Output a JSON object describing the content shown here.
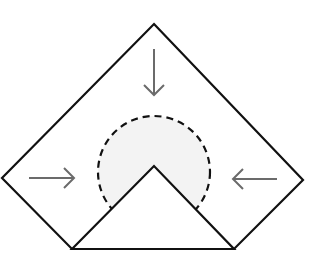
{
  "diagram": {
    "colors": {
      "outline": "#111111",
      "arrow": "#6b6b6b",
      "dashed_circle": "#111111",
      "circle_fill": "#f3f3f3",
      "background": "#ffffff"
    },
    "outer_shape": {
      "points": [
        [
          154,
          24
        ],
        [
          303,
          180
        ],
        [
          234,
          249
        ],
        [
          72,
          249
        ],
        [
          2,
          178
        ]
      ]
    },
    "inner_triangle": {
      "points": [
        [
          72,
          249
        ],
        [
          154,
          166
        ],
        [
          234,
          249
        ]
      ]
    },
    "dashed_circle": {
      "cx": 154,
      "cy": 172,
      "r": 56
    },
    "arrows": [
      {
        "name": "arrow-down",
        "direction": "down",
        "x1": 154,
        "y1": 49,
        "x2": 154,
        "y2": 95
      },
      {
        "name": "arrow-right",
        "direction": "right",
        "x1": 29,
        "y1": 178,
        "x2": 74,
        "y2": 178
      },
      {
        "name": "arrow-left",
        "direction": "left",
        "x1": 277,
        "y1": 179,
        "x2": 233,
        "y2": 179
      }
    ]
  }
}
